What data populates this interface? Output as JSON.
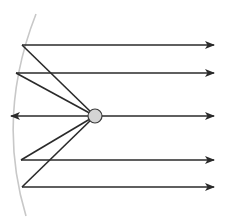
{
  "diagram": {
    "title": "Parabolic mirror reflecting rays from a point source at the focus into parallel rays",
    "colors": {
      "background": "#ffffff",
      "mirror": "#c8c8c8",
      "ray": "#2a2a2a",
      "source_fill": "#d4d4d4",
      "source_stroke": "#3a3a3a"
    },
    "mirror": {
      "type": "parabolic-arc",
      "path": "M36,14 Q-4,116 26,216"
    },
    "source": {
      "label": "point-source",
      "cx": 95,
      "cy": 116,
      "r": 7
    },
    "reflection_points": [
      {
        "x": 22,
        "y": 45
      },
      {
        "x": 16,
        "y": 73
      },
      {
        "x": 21,
        "y": 160
      },
      {
        "x": 22,
        "y": 187
      }
    ],
    "outgoing_rays": [
      {
        "y": 45,
        "x_start": 22,
        "x_end": 214
      },
      {
        "y": 73,
        "x_start": 16,
        "x_end": 214
      },
      {
        "y": 116,
        "x_start": 102,
        "x_end": 214
      },
      {
        "y": 160,
        "x_start": 21,
        "x_end": 214
      },
      {
        "y": 187,
        "x_start": 22,
        "x_end": 214
      }
    ],
    "backward_ray": {
      "y": 116,
      "x_start": 88,
      "x_end": 11
    }
  }
}
